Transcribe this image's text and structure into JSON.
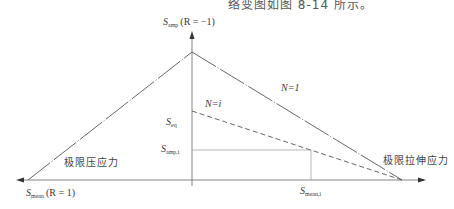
{
  "caption_fragment": "络变图如图 8-14 所示。",
  "axes": {
    "y_axis": {
      "symbol": "S",
      "subscript": "amp",
      "condition": "(R = −1)"
    },
    "x_axis": {
      "symbol": "S",
      "subscript": "mean",
      "condition": "(R = 1)"
    }
  },
  "curves": [
    {
      "id": "n1",
      "label": "N=1",
      "style": "dash-dot",
      "color": "#555555"
    },
    {
      "id": "ni",
      "label": "N=i",
      "style": "dashed",
      "color": "#555555"
    }
  ],
  "labels": {
    "s_eq": {
      "symbol": "S",
      "subscript": "eq"
    },
    "s_amp_i": {
      "symbol": "S",
      "subscript": "amp,i"
    },
    "s_mean_i": {
      "symbol": "S",
      "subscript": "mean,i"
    },
    "compressive_limit": "极限压应力",
    "tensile_limit": "极限拉伸应力"
  },
  "diagram_data": {
    "type": "diagram",
    "title": "Goodman-type constant life diagram",
    "nodes": [
      {
        "id": "peak",
        "label": "S_amp(R=-1)",
        "x": 192,
        "y": 52
      },
      {
        "id": "compress_limit",
        "label": "极限压应力",
        "x": 28,
        "y": 180
      },
      {
        "id": "tensile_limit",
        "label": "极限拉伸应力",
        "x": 402,
        "y": 180
      },
      {
        "id": "seq",
        "label": "S_eq",
        "x": 192,
        "y": 111
      },
      {
        "id": "point_i",
        "label": "(S_mean,i, S_amp,i)",
        "x": 311,
        "y": 150
      }
    ],
    "edges": [
      {
        "from": "compress_limit",
        "to": "peak",
        "style": "dash-dot",
        "label": ""
      },
      {
        "from": "peak",
        "to": "tensile_limit",
        "style": "dash-dot",
        "label": "N=1"
      },
      {
        "from": "seq",
        "to": "tensile_limit",
        "style": "dashed",
        "label": "N=i"
      },
      {
        "from": "S_amp,i axis",
        "to": "point_i",
        "style": "solid-thin",
        "label": "S_amp,i"
      },
      {
        "from": "point_i",
        "to": "S_mean,i axis",
        "style": "solid-thin",
        "label": "S_mean,i"
      }
    ]
  }
}
